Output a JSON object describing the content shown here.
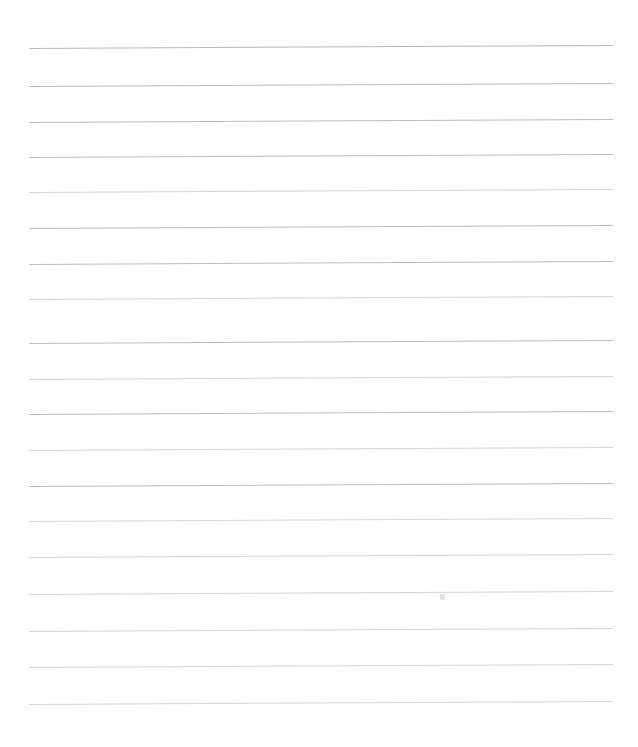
{
  "document": {
    "kind": "scanned-lined-paper",
    "title": "Blank Ruled Notebook Page",
    "page_width": 638,
    "page_height": 747,
    "background_color": "#fefefe",
    "has_text_content": false,
    "written_text": "",
    "visible_text_lines": []
  },
  "ruling": {
    "line_color": "#b2b5ba",
    "line_color_faint": "#c9ccd1",
    "line_thickness_px": 1,
    "line_start_x": 29,
    "line_end_x": 613,
    "line_count": 19,
    "average_spacing_px": 36,
    "tilt_degrees": -0.29,
    "lines": [
      {
        "index": 1,
        "y_left": 48,
        "y_right": 45,
        "opacity": 0.95
      },
      {
        "index": 2,
        "y_left": 86,
        "y_right": 83,
        "opacity": 0.95
      },
      {
        "index": 3,
        "y_left": 122,
        "y_right": 119,
        "opacity": 0.92
      },
      {
        "index": 4,
        "y_left": 157,
        "y_right": 154,
        "opacity": 0.9
      },
      {
        "index": 5,
        "y_left": 192,
        "y_right": 189,
        "opacity": 0.88
      },
      {
        "index": 6,
        "y_left": 228,
        "y_right": 225,
        "opacity": 0.92
      },
      {
        "index": 7,
        "y_left": 264,
        "y_right": 261,
        "opacity": 0.9
      },
      {
        "index": 8,
        "y_left": 299,
        "y_right": 296,
        "opacity": 0.86
      },
      {
        "index": 9,
        "y_left": 343,
        "y_right": 340,
        "opacity": 0.92
      },
      {
        "index": 10,
        "y_left": 379,
        "y_right": 376,
        "opacity": 0.88
      },
      {
        "index": 11,
        "y_left": 414,
        "y_right": 411,
        "opacity": 0.9
      },
      {
        "index": 12,
        "y_left": 450,
        "y_right": 447,
        "opacity": 0.86
      },
      {
        "index": 13,
        "y_left": 486,
        "y_right": 483,
        "opacity": 0.9
      },
      {
        "index": 14,
        "y_left": 521,
        "y_right": 518,
        "opacity": 0.8
      },
      {
        "index": 15,
        "y_left": 557,
        "y_right": 554,
        "opacity": 0.88
      },
      {
        "index": 16,
        "y_left": 594,
        "y_right": 591,
        "opacity": 0.88
      },
      {
        "index": 17,
        "y_left": 631,
        "y_right": 628,
        "opacity": 0.86
      },
      {
        "index": 18,
        "y_left": 667,
        "y_right": 664,
        "opacity": 0.84
      },
      {
        "index": 19,
        "y_left": 704,
        "y_right": 701,
        "opacity": 0.86
      }
    ]
  },
  "marks": {
    "speck": {
      "label": "faint-smudge",
      "x": 440,
      "y": 594,
      "width": 5,
      "height": 6,
      "color": "#dcdcdf"
    }
  }
}
